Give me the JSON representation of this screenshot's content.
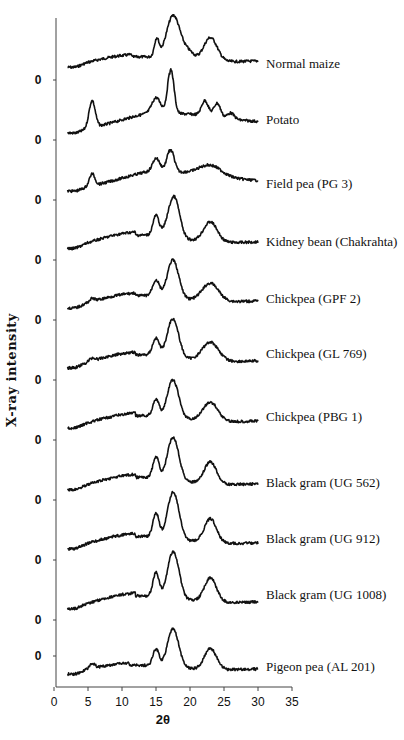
{
  "chart_data": {
    "type": "line",
    "title": "",
    "xlabel": "2θ",
    "ylabel": "X-ray intensity",
    "xlim": [
      0,
      35
    ],
    "x_ticks": [
      0,
      5,
      10,
      15,
      20,
      25,
      30,
      35
    ],
    "y_tick_labels": [
      "0",
      "0",
      "0",
      "0",
      "0",
      "0",
      "0",
      "0",
      "0",
      "0",
      "0",
      "0"
    ],
    "y_ticks_note": "stacked (offset) diffractograms; each trace has its own baseline marked '0'",
    "grid": false,
    "legend": "inline labels at right end of each trace",
    "x_range_of_traces": [
      2,
      30
    ],
    "series": [
      {
        "name": "Normal maize",
        "baseline": 70,
        "label_y": 64,
        "peaks": [
          [
            15.1,
            0.35,
            18
          ],
          [
            17.2,
            0.9,
            26
          ],
          [
            18.0,
            0.9,
            22
          ],
          [
            19.8,
            0.8,
            8
          ],
          [
            23.0,
            1.0,
            24
          ]
        ],
        "hump": [
          [
            11.5,
            6,
            12
          ]
        ],
        "end_level": 9
      },
      {
        "name": "Potato",
        "baseline": 134,
        "label_y": 120,
        "peaks": [
          [
            5.6,
            0.45,
            27
          ],
          [
            15.0,
            0.6,
            14
          ],
          [
            17.2,
            0.45,
            44
          ],
          [
            22.2,
            0.5,
            15
          ],
          [
            24.0,
            0.5,
            14
          ],
          [
            26.0,
            0.5,
            6
          ]
        ],
        "hump": [
          [
            17,
            7,
            18
          ]
        ],
        "end_level": 10
      },
      {
        "name": "Field pea (PG 3)",
        "baseline": 192,
        "label_y": 184,
        "peaks": [
          [
            5.6,
            0.4,
            12
          ],
          [
            15.0,
            0.5,
            12
          ],
          [
            17.2,
            0.5,
            22
          ],
          [
            23.0,
            1.6,
            10
          ]
        ],
        "hump": [
          [
            17,
            7,
            18
          ]
        ],
        "end_level": 9
      },
      {
        "name": "Kidney bean (Chakrahta)",
        "baseline": 252,
        "label_y": 242,
        "peaks": [
          [
            15.0,
            0.45,
            20
          ],
          [
            17.3,
            0.8,
            26
          ],
          [
            18.0,
            0.7,
            20
          ],
          [
            23.0,
            1.0,
            20
          ]
        ],
        "hump": [
          [
            12,
            6,
            16
          ]
        ],
        "end_level": 10
      },
      {
        "name": "Chickpea (GPF 2)",
        "baseline": 311,
        "label_y": 299,
        "peaks": [
          [
            5.6,
            0.4,
            3
          ],
          [
            15.0,
            0.5,
            16
          ],
          [
            17.2,
            0.7,
            26
          ],
          [
            18.0,
            0.7,
            18
          ],
          [
            23.0,
            1.2,
            18
          ]
        ],
        "hump": [
          [
            12,
            6,
            14
          ]
        ],
        "end_level": 10
      },
      {
        "name": "Chickpea (GL 769)",
        "baseline": 371,
        "label_y": 354,
        "peaks": [
          [
            5.6,
            0.4,
            3
          ],
          [
            15.0,
            0.5,
            17
          ],
          [
            17.2,
            0.7,
            27
          ],
          [
            18.0,
            0.7,
            18
          ],
          [
            23.0,
            1.2,
            19
          ]
        ],
        "hump": [
          [
            12,
            6,
            15
          ]
        ],
        "end_level": 10
      },
      {
        "name": "Chickpea (PBG 1)",
        "baseline": 431,
        "label_y": 417,
        "peaks": [
          [
            15.0,
            0.45,
            17
          ],
          [
            17.2,
            0.7,
            26
          ],
          [
            18.0,
            0.7,
            18
          ],
          [
            23.0,
            1.1,
            19
          ]
        ],
        "hump": [
          [
            12,
            6,
            14
          ]
        ],
        "end_level": 10
      },
      {
        "name": "Black gram (UG 562)",
        "baseline": 493,
        "label_y": 483,
        "peaks": [
          [
            15.0,
            0.45,
            21
          ],
          [
            17.2,
            0.7,
            28
          ],
          [
            18.0,
            0.7,
            22
          ],
          [
            23.0,
            0.9,
            22
          ]
        ],
        "hump": [
          [
            12,
            6,
            15
          ]
        ],
        "end_level": 9
      },
      {
        "name": "Black gram (UG 912)",
        "baseline": 552,
        "label_y": 539,
        "peaks": [
          [
            15.0,
            0.45,
            24
          ],
          [
            17.2,
            0.7,
            30
          ],
          [
            18.0,
            0.7,
            25
          ],
          [
            23.0,
            0.9,
            24
          ]
        ],
        "hump": [
          [
            12,
            6,
            15
          ]
        ],
        "end_level": 9
      },
      {
        "name": "Black gram (UG 1008)",
        "baseline": 612,
        "label_y": 595,
        "peaks": [
          [
            15.0,
            0.45,
            24
          ],
          [
            17.2,
            0.7,
            30
          ],
          [
            18.0,
            0.7,
            25
          ],
          [
            23.0,
            0.9,
            24
          ]
        ],
        "hump": [
          [
            12,
            6,
            15
          ]
        ],
        "end_level": 10
      },
      {
        "name": "Pigeon pea (AL 201)",
        "baseline": 677,
        "label_y": 667,
        "peaks": [
          [
            5.6,
            0.4,
            5
          ],
          [
            15.0,
            0.45,
            17
          ],
          [
            17.2,
            0.7,
            26
          ],
          [
            18.0,
            0.7,
            19
          ],
          [
            23.0,
            0.9,
            21
          ]
        ],
        "hump": [
          [
            11,
            6,
            11
          ]
        ],
        "end_level": 8
      }
    ]
  },
  "axes": {
    "x_title": "2θ",
    "y_title": "X-ray intensity",
    "x_tick_labels": [
      "0",
      "5",
      "10",
      "15",
      "20",
      "25",
      "30",
      "35"
    ],
    "zero_label": "0"
  },
  "layout": {
    "x0_px": 54,
    "px_per_unit": 6.8,
    "y_axis_x": 56,
    "y_axis_top": 18,
    "x_axis_y": 687,
    "zero_tick_ys": [
      80,
      140,
      200,
      260,
      320,
      380,
      440,
      500,
      560,
      620,
      656
    ],
    "label_x": 266,
    "trace_color": "#111111"
  }
}
